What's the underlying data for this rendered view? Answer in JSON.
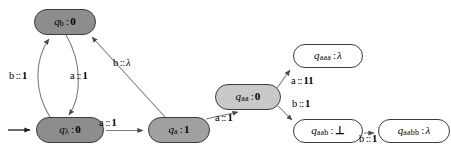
{
  "diagram": {
    "kind": "finite-state-transducer",
    "title": "",
    "colors": {
      "node_stroke": "#3b3b3b",
      "edge_stroke": "#6e6e6e",
      "fill_dark_gray": "#8d8d8d",
      "fill_mid_gray": "#a0a0a0",
      "fill_light_gray": "#c9c9c9",
      "fill_white": "#ffffff",
      "text": "#000000",
      "background": "#ffffff"
    },
    "nodes": [
      {
        "id": "q_lambda",
        "state_prefix": "q",
        "state_subscript": "λ",
        "separator": ":",
        "output": "0",
        "output_is_lambda": false,
        "fill": "dark-gray",
        "is_start": true,
        "x": 36,
        "y": 117,
        "w": 68,
        "h": 26
      },
      {
        "id": "q_b",
        "state_prefix": "q",
        "state_subscript": "b",
        "separator": ":",
        "output": "0",
        "output_is_lambda": false,
        "fill": "dark-gray",
        "is_start": false,
        "x": 34,
        "y": 9,
        "w": 62,
        "h": 26
      },
      {
        "id": "q_a",
        "state_prefix": "q",
        "state_subscript": "a",
        "separator": ":",
        "output": "1",
        "output_is_lambda": false,
        "fill": "mid-gray",
        "is_start": false,
        "x": 148,
        "y": 117,
        "w": 62,
        "h": 26
      },
      {
        "id": "q_aa",
        "state_prefix": "q",
        "state_subscript": "aa",
        "separator": ":",
        "output": "0",
        "output_is_lambda": false,
        "fill": "light-gray",
        "is_start": false,
        "x": 215,
        "y": 84,
        "w": 66,
        "h": 26
      },
      {
        "id": "q_aaa",
        "state_prefix": "q",
        "state_subscript": "aaa",
        "separator": ":",
        "output": "λ",
        "output_is_lambda": true,
        "fill": "white",
        "is_start": false,
        "x": 293,
        "y": 44,
        "w": 70,
        "h": 24
      },
      {
        "id": "q_aab",
        "state_prefix": "q",
        "state_subscript": "aab",
        "separator": ":",
        "output": "⊥",
        "output_is_lambda": false,
        "fill": "white",
        "is_start": false,
        "x": 293,
        "y": 119,
        "w": 70,
        "h": 24
      },
      {
        "id": "q_aabb",
        "state_prefix": "q",
        "state_subscript": "aabb",
        "separator": ":",
        "output": "λ",
        "output_is_lambda": true,
        "fill": "white",
        "is_start": false,
        "x": 378,
        "y": 119,
        "w": 72,
        "h": 24
      }
    ],
    "edges": [
      {
        "id": "start-arrow",
        "from": "",
        "to": "q_lambda",
        "symbol": "",
        "output": "",
        "has_label": false
      },
      {
        "id": "lambda-to-b",
        "from": "q_lambda",
        "to": "q_b",
        "symbol": "b",
        "separator": "::",
        "output": "1",
        "output_is_lambda": false,
        "has_label": true,
        "label_x": 9,
        "label_y": 71
      },
      {
        "id": "b-to-lambda",
        "from": "q_b",
        "to": "q_lambda",
        "symbol": "a",
        "separator": "::",
        "output": "1",
        "output_is_lambda": false,
        "has_label": true,
        "label_x": 70,
        "label_y": 71
      },
      {
        "id": "a-to-b",
        "from": "q_a",
        "to": "q_b",
        "symbol": "b",
        "separator": "::",
        "output": "λ",
        "output_is_lambda": true,
        "has_label": true,
        "label_x": 113,
        "label_y": 58
      },
      {
        "id": "lambda-to-a",
        "from": "q_lambda",
        "to": "q_a",
        "symbol": "a",
        "separator": "::",
        "output": "1",
        "output_is_lambda": false,
        "has_label": true,
        "label_x": 99,
        "label_y": 118
      },
      {
        "id": "a-to-aa",
        "from": "q_a",
        "to": "q_aa",
        "symbol": "a",
        "separator": "::",
        "output": "1",
        "output_is_lambda": false,
        "has_label": true,
        "label_x": 215,
        "label_y": 113
      },
      {
        "id": "aa-to-aaa",
        "from": "q_aa",
        "to": "q_aaa",
        "symbol": "a",
        "separator": "::",
        "output": "11",
        "output_is_lambda": false,
        "has_label": true,
        "label_x": 291,
        "label_y": 76
      },
      {
        "id": "aa-to-aab",
        "from": "q_aa",
        "to": "q_aab",
        "symbol": "b",
        "separator": "::",
        "output": "1",
        "output_is_lambda": false,
        "has_label": true,
        "label_x": 292,
        "label_y": 99
      },
      {
        "id": "aab-to-aabb",
        "from": "q_aab",
        "to": "q_aabb",
        "symbol": "b",
        "separator": "::",
        "output": "1",
        "output_is_lambda": false,
        "has_label": true,
        "label_x": 359,
        "label_y": 134
      }
    ]
  }
}
